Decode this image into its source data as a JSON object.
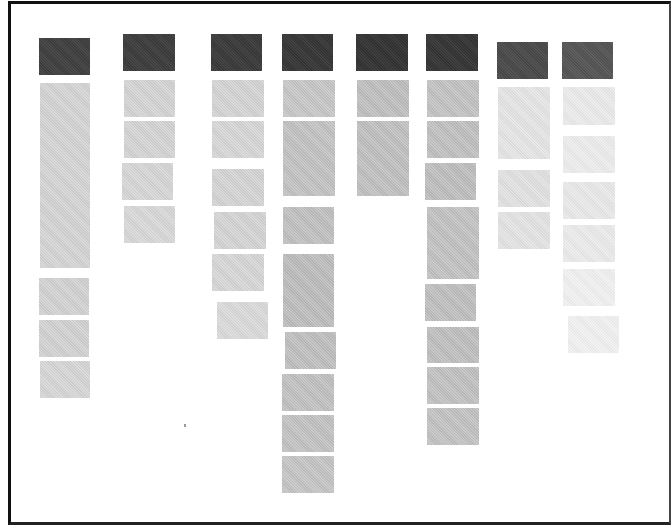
{
  "diagram": {
    "type": "card-column-board",
    "frame": {
      "border_color": "#111111",
      "background": "#ffffff"
    },
    "colors": {
      "header_dark": "#3a3a3a",
      "header_medium": "#4a4a4a",
      "item_light": "#d4d4d4",
      "item_medium": "#bdbdbd",
      "item_faint": "#e6e6e6",
      "item_very_faint": "#eeeeee"
    },
    "columns": [
      {
        "id": "col-1",
        "header": {
          "x": 39,
          "y": 38,
          "w": 51,
          "h": 37,
          "color": "#404040"
        },
        "cards": [
          {
            "x": 40,
            "y": 83,
            "w": 50,
            "h": 185,
            "color": "#d2d2d2"
          },
          {
            "x": 39,
            "y": 278,
            "w": 50,
            "h": 37,
            "color": "#d0d0d0"
          },
          {
            "x": 39,
            "y": 320,
            "w": 50,
            "h": 37,
            "color": "#d0d0d0"
          },
          {
            "x": 40,
            "y": 361,
            "w": 50,
            "h": 37,
            "color": "#d4d4d4"
          }
        ]
      },
      {
        "id": "col-2",
        "header": {
          "x": 123,
          "y": 34,
          "w": 52,
          "h": 37,
          "color": "#3d3d3d"
        },
        "cards": [
          {
            "x": 124,
            "y": 80,
            "w": 51,
            "h": 37,
            "color": "#d2d2d2"
          },
          {
            "x": 124,
            "y": 121,
            "w": 51,
            "h": 37,
            "color": "#d2d2d2"
          },
          {
            "x": 122,
            "y": 163,
            "w": 51,
            "h": 37,
            "color": "#d4d4d4"
          },
          {
            "x": 124,
            "y": 206,
            "w": 51,
            "h": 37,
            "color": "#d6d6d6"
          }
        ]
      },
      {
        "id": "col-3",
        "header": {
          "x": 211,
          "y": 34,
          "w": 51,
          "h": 37,
          "color": "#3a3a3a"
        },
        "cards": [
          {
            "x": 212,
            "y": 80,
            "w": 52,
            "h": 37,
            "color": "#d2d2d2"
          },
          {
            "x": 212,
            "y": 121,
            "w": 52,
            "h": 37,
            "color": "#d4d4d4"
          },
          {
            "x": 212,
            "y": 169,
            "w": 52,
            "h": 37,
            "color": "#d2d2d2"
          },
          {
            "x": 214,
            "y": 212,
            "w": 52,
            "h": 37,
            "color": "#d2d2d2"
          },
          {
            "x": 212,
            "y": 254,
            "w": 52,
            "h": 37,
            "color": "#d4d4d4"
          },
          {
            "x": 217,
            "y": 302,
            "w": 51,
            "h": 37,
            "color": "#d8d8d8"
          }
        ]
      },
      {
        "id": "col-4",
        "header": {
          "x": 282,
          "y": 34,
          "w": 51,
          "h": 37,
          "color": "#363636"
        },
        "cards": [
          {
            "x": 283,
            "y": 80,
            "w": 52,
            "h": 37,
            "color": "#c4c4c4"
          },
          {
            "x": 283,
            "y": 121,
            "w": 52,
            "h": 75,
            "color": "#c0c0c0"
          },
          {
            "x": 283,
            "y": 207,
            "w": 51,
            "h": 37,
            "color": "#bdbdbd"
          },
          {
            "x": 283,
            "y": 254,
            "w": 51,
            "h": 73,
            "color": "#bababa"
          },
          {
            "x": 285,
            "y": 332,
            "w": 51,
            "h": 37,
            "color": "#bcbcbc"
          },
          {
            "x": 282,
            "y": 374,
            "w": 52,
            "h": 37,
            "color": "#bebebe"
          },
          {
            "x": 282,
            "y": 415,
            "w": 52,
            "h": 37,
            "color": "#bfbfbf"
          },
          {
            "x": 282,
            "y": 456,
            "w": 52,
            "h": 37,
            "color": "#c2c2c2"
          }
        ]
      },
      {
        "id": "col-5",
        "header": {
          "x": 356,
          "y": 34,
          "w": 52,
          "h": 37,
          "color": "#333333"
        },
        "cards": [
          {
            "x": 357,
            "y": 80,
            "w": 52,
            "h": 37,
            "color": "#bcbcbc"
          },
          {
            "x": 357,
            "y": 121,
            "w": 52,
            "h": 75,
            "color": "#bdbdbd"
          }
        ]
      },
      {
        "id": "col-6",
        "header": {
          "x": 426,
          "y": 34,
          "w": 52,
          "h": 37,
          "color": "#353535"
        },
        "cards": [
          {
            "x": 427,
            "y": 80,
            "w": 52,
            "h": 37,
            "color": "#c0c0c0"
          },
          {
            "x": 427,
            "y": 121,
            "w": 52,
            "h": 37,
            "color": "#bdbdbd"
          },
          {
            "x": 425,
            "y": 163,
            "w": 51,
            "h": 37,
            "color": "#bbbbbb"
          },
          {
            "x": 427,
            "y": 207,
            "w": 52,
            "h": 72,
            "color": "#bfbfbf"
          },
          {
            "x": 425,
            "y": 284,
            "w": 51,
            "h": 37,
            "color": "#bcbcbc"
          },
          {
            "x": 427,
            "y": 327,
            "w": 52,
            "h": 36,
            "color": "#bcbcbc"
          },
          {
            "x": 427,
            "y": 367,
            "w": 52,
            "h": 37,
            "color": "#bebebe"
          },
          {
            "x": 427,
            "y": 408,
            "w": 52,
            "h": 37,
            "color": "#c0c0c0"
          }
        ]
      },
      {
        "id": "col-7",
        "header": {
          "x": 497,
          "y": 42,
          "w": 51,
          "h": 37,
          "color": "#4a4a4a"
        },
        "cards": [
          {
            "x": 498,
            "y": 87,
            "w": 52,
            "h": 72,
            "color": "#e4e4e4"
          },
          {
            "x": 498,
            "y": 170,
            "w": 52,
            "h": 37,
            "color": "#e0e0e0"
          },
          {
            "x": 498,
            "y": 212,
            "w": 52,
            "h": 37,
            "color": "#e2e2e2"
          }
        ]
      },
      {
        "id": "col-8",
        "header": {
          "x": 562,
          "y": 42,
          "w": 51,
          "h": 37,
          "color": "#555555"
        },
        "cards": [
          {
            "x": 563,
            "y": 87,
            "w": 52,
            "h": 38,
            "color": "#eaeaea"
          },
          {
            "x": 563,
            "y": 136,
            "w": 52,
            "h": 37,
            "color": "#ececec"
          },
          {
            "x": 563,
            "y": 182,
            "w": 52,
            "h": 37,
            "color": "#e8e8e8"
          },
          {
            "x": 563,
            "y": 225,
            "w": 52,
            "h": 37,
            "color": "#eaeaea"
          },
          {
            "x": 563,
            "y": 269,
            "w": 52,
            "h": 37,
            "color": "#f0f0f0"
          },
          {
            "x": 568,
            "y": 316,
            "w": 51,
            "h": 37,
            "color": "#f0f0f0"
          }
        ]
      }
    ],
    "specks": [
      {
        "x": 184,
        "y": 424
      }
    ]
  }
}
